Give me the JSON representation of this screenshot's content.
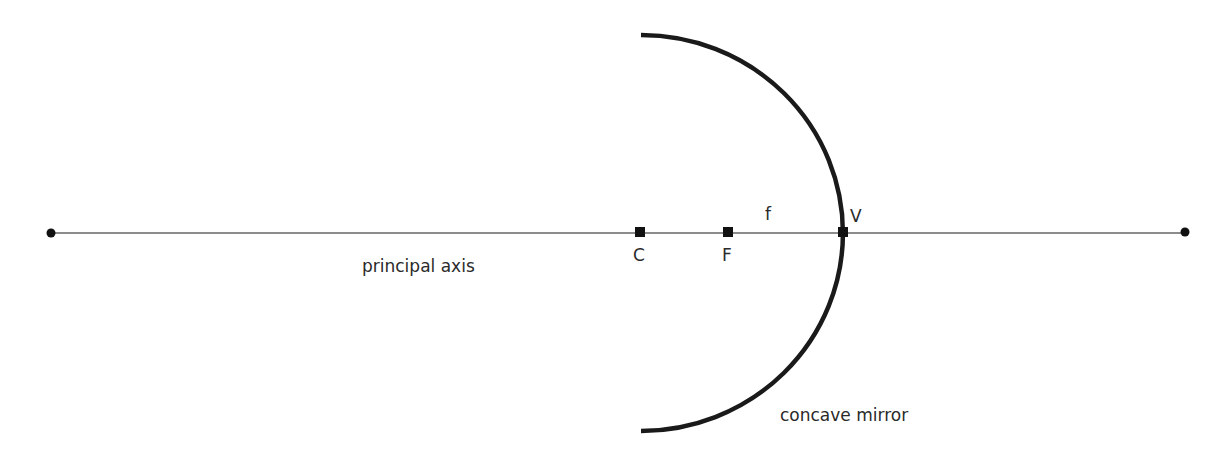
{
  "diagram": {
    "axis": {
      "label": "principal axis",
      "x1": 51,
      "x2": 1185,
      "y": 233
    },
    "mirror": {
      "label": "concave mirror",
      "top": [
        641,
        35
      ],
      "bottom": [
        641,
        431
      ],
      "vertex": [
        843,
        233
      ]
    },
    "points": [
      {
        "id": "C",
        "label": "C",
        "x": 640,
        "y": 232
      },
      {
        "id": "F",
        "label": "F",
        "x": 728,
        "y": 232
      },
      {
        "id": "V",
        "label": "V",
        "x": 843,
        "y": 232
      }
    ],
    "focal_length_label": "f",
    "colors": {
      "line": "#555555",
      "mirror": "#1a1a1a",
      "marker": "#111111",
      "text": "#2a2a2a"
    }
  }
}
